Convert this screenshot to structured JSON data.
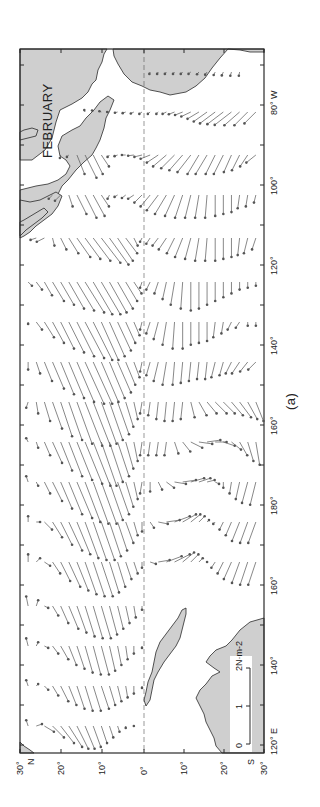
{
  "figure": {
    "month_label": "FEBRUARY",
    "panel_caption": "(a)",
    "colors": {
      "land": "#cfcfcf",
      "ink": "#2a2a2a",
      "vector": "#555555",
      "background": "#ffffff"
    }
  },
  "frame": {
    "left": 20,
    "right": 264,
    "top": 49,
    "bottom": 753
  },
  "latitude_axis": {
    "orientation": "horizontal (rotated map: north to the left)",
    "ticks": [
      {
        "lat": 30,
        "x": 20,
        "label": "30°",
        "hemi": "N"
      },
      {
        "lat": 20,
        "x": 61,
        "label": "20°"
      },
      {
        "lat": 10,
        "x": 102,
        "label": "10°"
      },
      {
        "lat": 0,
        "x": 144,
        "label": "0°"
      },
      {
        "lat": -10,
        "x": 184,
        "label": "10°"
      },
      {
        "lat": -20,
        "x": 224,
        "label": "20°"
      },
      {
        "lat": -30,
        "x": 264,
        "label": "30°",
        "hemi": "S"
      }
    ]
  },
  "longitude_axis": {
    "orientation": "vertical (rotated map: east to the top)",
    "labels": [
      {
        "y": 745,
        "label": "120° E"
      },
      {
        "y": 665,
        "label": "140°"
      },
      {
        "y": 585,
        "label": "160°"
      },
      {
        "y": 505,
        "label": "180°"
      },
      {
        "y": 425,
        "label": "160°"
      },
      {
        "y": 345,
        "label": "140°"
      },
      {
        "y": 265,
        "label": "120°"
      },
      {
        "y": 185,
        "label": "100°"
      },
      {
        "y": 105,
        "label": "80° W"
      }
    ],
    "minor_tick_spacing_px": 40
  },
  "scale_bar": {
    "unit_label": "2N·m-2",
    "tick_labels": [
      "0",
      "1",
      "2"
    ],
    "length_px": 76
  },
  "vector_field": {
    "description": "Mean February surface wind stress vectors over the tropical Pacific, one row per ~5° longitude, one arrow per 2° latitude",
    "scale_px_per_Nm2": 38,
    "rows": [
      {
        "y": 72,
        "lon": "82W",
        "lats_from": -2,
        "lats_to": -24,
        "tx": [
          -0.05,
          -0.05,
          -0.05,
          -0.05,
          -0.05,
          -0.05,
          -0.06,
          -0.07,
          -0.08,
          -0.09,
          -0.1,
          -0.1
        ],
        "ty": [
          0.02,
          0.03,
          0.04,
          0.04,
          0.05,
          0.06,
          0.05,
          0.05,
          0.04,
          0.04,
          0.03,
          0.02
        ]
      },
      {
        "y": 112,
        "lon": "88W",
        "lats_from": 14,
        "lats_to": -28,
        "tx": [
          0.05,
          0.04,
          0.02,
          0.0,
          -0.02,
          -0.03,
          -0.04,
          -0.05,
          -0.05,
          -0.05,
          -0.05,
          -0.06,
          -0.08,
          -0.12,
          -0.18,
          -0.25,
          -0.3,
          -0.32,
          -0.34,
          -0.35,
          -0.35,
          -0.3
        ],
        "ty": [
          0.02,
          0.03,
          0.05,
          0.06,
          0.07,
          0.08,
          0.08,
          0.07,
          0.06,
          0.05,
          0.1,
          0.15,
          0.2,
          0.25,
          0.3,
          0.35,
          0.4,
          0.42,
          0.44,
          0.4,
          0.35,
          0.3
        ]
      },
      {
        "y": 155,
        "lon": "95W",
        "lats_from": 20,
        "lats_to": -28,
        "tx": [
          -0.08,
          -0.05,
          -0.5,
          -0.6,
          -0.5,
          -0.3,
          -0.05,
          -0.03,
          0.0,
          -0.02,
          -0.05,
          -0.1,
          -0.2,
          -0.3,
          -0.35,
          -0.4,
          -0.45,
          -0.5,
          -0.5,
          -0.5,
          -0.5,
          -0.45,
          -0.4,
          -0.3,
          -0.2
        ],
        "ty": [
          0.02,
          0.05,
          -0.2,
          -0.3,
          -0.25,
          -0.2,
          0.05,
          0.08,
          0.1,
          0.15,
          0.2,
          0.25,
          0.3,
          0.35,
          0.35,
          0.35,
          0.35,
          0.3,
          0.3,
          0.25,
          0.25,
          0.2,
          0.2,
          0.2,
          0.25
        ]
      },
      {
        "y": 195,
        "lon": "102W",
        "lats_from": 22,
        "lats_to": -28,
        "tx": [
          -0.1,
          -0.15,
          -0.3,
          -0.5,
          -0.6,
          -0.55,
          -0.3,
          -0.1,
          -0.05,
          -0.08,
          -0.1,
          -0.2,
          -0.3,
          -0.4,
          -0.5,
          -0.55,
          -0.6,
          -0.6,
          -0.6,
          -0.6,
          -0.55,
          -0.5,
          -0.45,
          -0.35,
          -0.3,
          -0.2
        ],
        "ty": [
          0.1,
          0.15,
          -0.1,
          -0.25,
          -0.3,
          -0.3,
          -0.2,
          0.05,
          0.08,
          0.1,
          0.15,
          0.2,
          0.25,
          0.3,
          0.3,
          0.25,
          0.2,
          0.15,
          0.1,
          0.05,
          0.0,
          0.0,
          0.0,
          0.05,
          0.05,
          0.05
        ]
      },
      {
        "y": 238,
        "lon": "110W",
        "lats_from": 26,
        "lats_to": -28,
        "tx": [
          -0.05,
          -0.1,
          -0.2,
          -0.3,
          -0.4,
          -0.5,
          -0.55,
          -0.6,
          -0.65,
          -0.7,
          -0.6,
          -0.4,
          -0.2,
          -0.1,
          -0.15,
          -0.2,
          -0.3,
          -0.4,
          -0.5,
          -0.55,
          -0.6,
          -0.6,
          -0.6,
          -0.55,
          -0.5,
          -0.45,
          -0.4,
          -0.3
        ],
        "ty": [
          0.15,
          0.2,
          -0.05,
          -0.15,
          -0.25,
          -0.35,
          -0.4,
          -0.45,
          -0.5,
          -0.5,
          -0.4,
          -0.3,
          -0.1,
          0.05,
          0.1,
          0.15,
          0.2,
          0.2,
          0.2,
          0.15,
          0.1,
          0.05,
          0.0,
          0.0,
          0.0,
          0.05,
          0.1,
          0.1
        ]
      },
      {
        "y": 282,
        "lon": "118W",
        "lats_from": 28,
        "lats_to": -28,
        "tx": [
          -0.1,
          -0.2,
          -0.35,
          -0.5,
          -0.6,
          -0.7,
          -0.75,
          -0.8,
          -0.85,
          -0.85,
          -0.8,
          -0.7,
          -0.5,
          -0.3,
          -0.15,
          -0.2,
          -0.3,
          -0.45,
          -0.6,
          -0.7,
          -0.75,
          -0.7,
          -0.6,
          -0.5,
          -0.4,
          -0.3,
          -0.2,
          -0.15,
          -0.1
        ],
        "ty": [
          -0.1,
          -0.15,
          -0.2,
          -0.3,
          -0.35,
          -0.4,
          -0.45,
          -0.5,
          -0.5,
          -0.5,
          -0.45,
          -0.4,
          -0.3,
          -0.2,
          0.05,
          0.1,
          0.1,
          0.1,
          0.1,
          0.05,
          0.0,
          0.0,
          0.0,
          0.0,
          0.0,
          0.0,
          0.0,
          0.0,
          0.0
        ]
      },
      {
        "y": 322,
        "lon": "125W",
        "lats_from": 28,
        "lats_to": -28,
        "tx": [
          -0.05,
          -0.2,
          -0.4,
          -0.55,
          -0.7,
          -0.8,
          -0.9,
          -0.95,
          -1.0,
          -1.0,
          -0.9,
          -0.75,
          -0.55,
          -0.35,
          -0.2,
          -0.3,
          -0.45,
          -0.6,
          -0.7,
          -0.7,
          -0.6,
          -0.55,
          -0.5,
          -0.4,
          -0.3,
          -0.2,
          -0.15,
          -0.1,
          -0.1
        ],
        "ty": [
          0.0,
          -0.15,
          -0.25,
          -0.3,
          -0.35,
          -0.4,
          -0.45,
          -0.5,
          -0.5,
          -0.45,
          -0.4,
          -0.35,
          -0.25,
          -0.15,
          0.05,
          0.1,
          0.12,
          0.1,
          0.05,
          0.0,
          0.0,
          0.0,
          0.0,
          0.05,
          0.05,
          0.1,
          0.1,
          0.0,
          0.0
        ]
      },
      {
        "y": 362,
        "lon": "132W",
        "lats_from": 28,
        "lats_to": -28,
        "tx": [
          -0.2,
          -0.3,
          -0.5,
          -0.7,
          -0.85,
          -0.95,
          -1.05,
          -1.1,
          -1.1,
          -1.05,
          -0.95,
          -0.8,
          -0.6,
          -0.4,
          -0.25,
          -0.35,
          -0.5,
          -0.6,
          -0.6,
          -0.55,
          -0.5,
          -0.45,
          -0.45,
          -0.4,
          -0.35,
          -0.3,
          -0.3,
          -0.25,
          -0.2
        ],
        "ty": [
          0.0,
          -0.1,
          -0.2,
          -0.3,
          -0.35,
          -0.4,
          -0.45,
          -0.5,
          -0.5,
          -0.45,
          -0.4,
          -0.35,
          -0.25,
          -0.15,
          0.05,
          0.1,
          0.12,
          0.1,
          0.05,
          0.05,
          0.05,
          0.05,
          0.05,
          0.1,
          0.1,
          0.15,
          0.2,
          0.2,
          0.2
        ]
      },
      {
        "y": 402,
        "lon": "140W",
        "lats_from": 28,
        "lats_to": -28,
        "tx": [
          -0.15,
          -0.3,
          -0.5,
          -0.7,
          -0.9,
          -1.0,
          -1.1,
          -1.15,
          -1.15,
          -1.1,
          -1.0,
          -0.85,
          -0.65,
          -0.45,
          -0.3,
          -0.35,
          -0.45,
          -0.5,
          -0.5,
          -0.45,
          -0.4,
          -0.35,
          -0.3,
          -0.3,
          -0.3,
          -0.35,
          -0.4,
          -0.45,
          -0.5
        ],
        "ty": [
          0.05,
          -0.05,
          -0.15,
          -0.25,
          -0.3,
          -0.35,
          -0.4,
          -0.45,
          -0.45,
          -0.4,
          -0.35,
          -0.3,
          -0.2,
          -0.1,
          0.05,
          0.05,
          0.05,
          0.05,
          0.05,
          0.05,
          -0.1,
          -0.2,
          -0.25,
          -0.3,
          -0.3,
          -0.3,
          -0.3,
          -0.25,
          -0.2
        ]
      },
      {
        "y": 442,
        "lon": "150W",
        "lats_from": 28,
        "lats_to": -28,
        "tx": [
          0.1,
          -0.15,
          -0.35,
          -0.55,
          -0.75,
          -0.9,
          -1.0,
          -1.1,
          -1.15,
          -1.15,
          -1.05,
          -0.9,
          -0.7,
          -0.5,
          -0.35,
          -0.35,
          -0.35,
          -0.35,
          -0.3,
          -0.25,
          -0.15,
          -0.05,
          0.05,
          0.0,
          -0.1,
          -0.2,
          -0.35,
          -0.5,
          -0.6
        ],
        "ty": [
          0.05,
          -0.05,
          -0.15,
          -0.25,
          -0.3,
          -0.35,
          -0.4,
          -0.45,
          -0.45,
          -0.4,
          -0.35,
          -0.3,
          -0.2,
          -0.1,
          0.05,
          0.05,
          0.05,
          0.05,
          -0.1,
          -0.2,
          -0.3,
          -0.35,
          -0.35,
          -0.3,
          -0.3,
          -0.25,
          -0.2,
          -0.15,
          -0.1
        ]
      },
      {
        "y": 482,
        "lon": "160W",
        "lats_from": 28,
        "lats_to": -28,
        "tx": [
          0.15,
          -0.1,
          -0.3,
          -0.5,
          -0.7,
          -0.85,
          -0.95,
          -1.05,
          -1.1,
          -1.1,
          -1.0,
          -0.85,
          -0.65,
          -0.45,
          -0.3,
          -0.25,
          -0.2,
          -0.15,
          -0.05,
          0.05,
          0.1,
          0.1,
          0.05,
          -0.05,
          -0.15,
          -0.3,
          -0.45,
          -0.55,
          -0.6
        ],
        "ty": [
          0.05,
          -0.05,
          -0.15,
          -0.25,
          -0.3,
          -0.35,
          -0.4,
          -0.4,
          -0.4,
          -0.4,
          -0.35,
          -0.3,
          -0.2,
          -0.1,
          0.05,
          0.0,
          -0.1,
          -0.2,
          -0.3,
          -0.35,
          -0.35,
          -0.3,
          -0.2,
          -0.1,
          0.0,
          0.05,
          0.1,
          0.15,
          0.15
        ]
      },
      {
        "y": 522,
        "lon": "175W",
        "lats_from": 28,
        "lats_to": -28,
        "tx": [
          0.15,
          0.0,
          -0.2,
          -0.4,
          -0.6,
          -0.75,
          -0.85,
          -0.95,
          -1.0,
          -1.0,
          -0.9,
          -0.75,
          -0.55,
          -0.35,
          -0.25,
          -0.15,
          -0.05,
          0.05,
          0.15,
          0.2,
          0.2,
          0.15,
          0.05,
          -0.05,
          -0.2,
          -0.35,
          -0.5,
          -0.55,
          -0.55
        ],
        "ty": [
          0.0,
          -0.1,
          -0.2,
          -0.25,
          -0.3,
          -0.35,
          -0.35,
          -0.35,
          -0.35,
          -0.35,
          -0.3,
          -0.25,
          -0.2,
          -0.1,
          0.0,
          -0.1,
          -0.25,
          -0.35,
          -0.4,
          -0.35,
          -0.25,
          -0.15,
          -0.05,
          0.05,
          0.1,
          0.15,
          0.2,
          0.2,
          0.2
        ]
      },
      {
        "y": 562,
        "lon": "170E",
        "lats_from": 28,
        "lats_to": -28,
        "tx": [
          0.2,
          0.1,
          -0.1,
          -0.3,
          -0.5,
          -0.65,
          -0.75,
          -0.85,
          -0.9,
          -0.9,
          -0.8,
          -0.65,
          -0.45,
          -0.3,
          -0.15,
          -0.05,
          0.05,
          0.15,
          0.2,
          0.25,
          0.2,
          0.1,
          0.0,
          -0.15,
          -0.3,
          -0.45,
          -0.55,
          -0.6,
          -0.6
        ],
        "ty": [
          0.0,
          -0.1,
          -0.15,
          -0.2,
          -0.25,
          -0.3,
          -0.3,
          -0.3,
          -0.3,
          -0.3,
          -0.25,
          -0.2,
          -0.15,
          -0.1,
          0.0,
          -0.15,
          -0.3,
          -0.4,
          -0.4,
          -0.3,
          -0.2,
          -0.1,
          0.0,
          0.1,
          0.15,
          0.2,
          0.2,
          0.2,
          0.2
        ]
      },
      {
        "y": 606,
        "lon": "155E",
        "lats_from": 28,
        "lats_to": 0,
        "tx": [
          0.25,
          0.15,
          -0.05,
          -0.25,
          -0.45,
          -0.6,
          -0.7,
          -0.8,
          -0.85,
          -0.85,
          -0.75,
          -0.6,
          -0.45,
          -0.3,
          -0.1
        ],
        "ty": [
          0.05,
          -0.05,
          -0.1,
          -0.15,
          -0.2,
          -0.25,
          -0.25,
          -0.25,
          -0.25,
          -0.25,
          -0.2,
          -0.15,
          -0.1,
          -0.05,
          0.0
        ]
      },
      {
        "y": 646,
        "lon": "145E",
        "lats_from": 28,
        "lats_to": 0,
        "tx": [
          0.2,
          0.1,
          -0.05,
          -0.2,
          -0.35,
          -0.5,
          -0.6,
          -0.7,
          -0.75,
          -0.75,
          -0.65,
          -0.5,
          -0.35,
          -0.2,
          -0.05
        ],
        "ty": [
          0.05,
          -0.05,
          -0.1,
          -0.15,
          -0.2,
          -0.2,
          -0.2,
          -0.2,
          -0.2,
          -0.2,
          -0.15,
          -0.1,
          -0.05,
          0.0,
          0.0
        ]
      },
      {
        "y": 686,
        "lon": "135E",
        "lats_from": 28,
        "lats_to": 0,
        "tx": [
          0.15,
          0.05,
          -0.1,
          -0.25,
          -0.4,
          -0.5,
          -0.6,
          -0.65,
          -0.65,
          -0.6,
          -0.5,
          -0.4,
          -0.3,
          -0.2,
          -0.05
        ],
        "ty": [
          0.05,
          -0.05,
          -0.1,
          -0.15,
          -0.2,
          -0.2,
          -0.2,
          -0.2,
          -0.2,
          -0.2,
          -0.15,
          -0.1,
          -0.05,
          0.0,
          0.0
        ]
      },
      {
        "y": 726,
        "lon": "125E",
        "lats_from": 28,
        "lats_to": 2,
        "tx": [
          0.15,
          0.05,
          -0.15,
          -0.3,
          -0.45,
          -0.55,
          -0.6,
          -0.6,
          -0.55,
          -0.45,
          -0.3,
          -0.15,
          -0.05,
          0.0
        ],
        "ty": [
          0.05,
          -0.15,
          -0.25,
          -0.3,
          -0.35,
          -0.35,
          -0.3,
          -0.25,
          -0.2,
          -0.15,
          -0.1,
          -0.05,
          0.0,
          0.0
        ]
      }
    ]
  }
}
